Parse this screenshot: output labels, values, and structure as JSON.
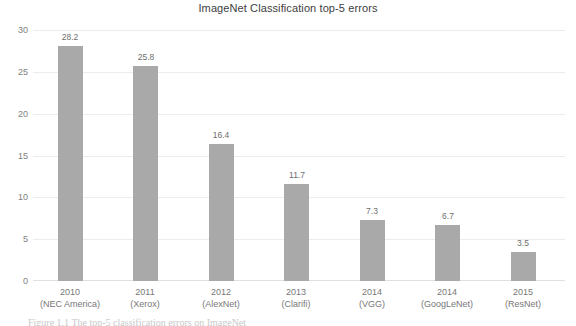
{
  "chart_data": {
    "type": "bar",
    "title": "ImageNet Classification top-5 errors",
    "xlabel": "",
    "ylabel": "",
    "ylim": [
      0,
      30
    ],
    "yticks": [
      "0",
      "5",
      "10",
      "15",
      "20",
      "25",
      "30"
    ],
    "grid": true,
    "legend": null,
    "bar_color": "#a9a9a9",
    "categories": [
      "2010 (NEC America)",
      "2011 (Xerox)",
      "2012 (AlexNet)",
      "2013 (Clarifi)",
      "2014 (VGG)",
      "2014 (GoogLeNet)",
      "2015 (ResNet)"
    ],
    "category_years": [
      "2010",
      "2011",
      "2012",
      "2013",
      "2014",
      "2014",
      "2015"
    ],
    "category_subs": [
      "(NEC America)",
      "(Xerox)",
      "(AlexNet)",
      "(Clarifi)",
      "(VGG)",
      "(GoogLeNet)",
      "(ResNet)"
    ],
    "values": [
      28.2,
      25.8,
      16.4,
      11.7,
      7.3,
      6.7,
      3.5
    ],
    "value_labels": [
      "28.2",
      "25.8",
      "16.4",
      "11.7",
      "7.3",
      "6.7",
      "3.5"
    ]
  },
  "caption": {
    "text": "Figure 1.1 The top-5 classification errors on ImageNet"
  }
}
